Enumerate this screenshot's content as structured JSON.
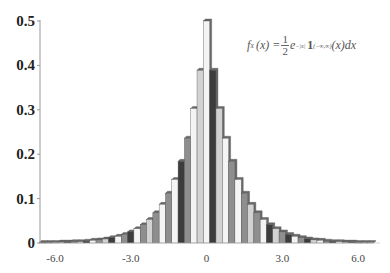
{
  "chart_data": {
    "type": "bar",
    "title": "",
    "annotation": "f_X(x) = 1/2 e^{-|x|} 1_{(-∞,∞)}(x) dx",
    "xlabel": "",
    "ylabel": "",
    "bin_width": 0.25,
    "xlim": [
      -6.625,
      6.625
    ],
    "ylim": [
      0,
      0.5
    ],
    "x_ticks": [
      -6.0,
      -3.0,
      0,
      3.0,
      6.0
    ],
    "x_tick_labels": [
      "-6.0",
      "-3.0",
      "0",
      "3.0",
      "6.0"
    ],
    "y_ticks": [
      0,
      0.1,
      0.2,
      0.3,
      0.4,
      0.5
    ],
    "y_tick_labels": [
      "0",
      "0.1",
      "0.2",
      "0.3",
      "0.4",
      "0.5"
    ],
    "grid": false,
    "legend": null,
    "categories": [
      -6.5,
      -6.25,
      -6.0,
      -5.75,
      -5.5,
      -5.25,
      -5.0,
      -4.75,
      -4.5,
      -4.25,
      -4.0,
      -3.75,
      -3.5,
      -3.25,
      -3.0,
      -2.75,
      -2.5,
      -2.25,
      -2.0,
      -1.75,
      -1.5,
      -1.25,
      -1.0,
      -0.75,
      -0.5,
      -0.25,
      0,
      0.25,
      0.5,
      0.75,
      1.0,
      1.25,
      1.5,
      1.75,
      2.0,
      2.25,
      2.5,
      2.75,
      3.0,
      3.25,
      3.5,
      3.75,
      4.0,
      4.25,
      4.5,
      4.75,
      5.0,
      5.25,
      5.5,
      5.75,
      6.0,
      6.25,
      6.5
    ],
    "values": [
      0.001,
      0.001,
      0.001,
      0.002,
      0.002,
      0.003,
      0.003,
      0.004,
      0.006,
      0.007,
      0.009,
      0.012,
      0.015,
      0.019,
      0.025,
      0.032,
      0.041,
      0.053,
      0.068,
      0.087,
      0.112,
      0.143,
      0.184,
      0.236,
      0.303,
      0.389,
      0.5,
      0.389,
      0.303,
      0.236,
      0.184,
      0.143,
      0.112,
      0.087,
      0.068,
      0.053,
      0.041,
      0.032,
      0.025,
      0.019,
      0.015,
      0.012,
      0.009,
      0.007,
      0.006,
      0.004,
      0.003,
      0.003,
      0.002,
      0.002,
      0.001,
      0.001,
      0.001
    ],
    "bar_colors": [
      "#f4f4f4",
      "#d2d2d2",
      "#8e8e8e",
      "#3c3c3c"
    ],
    "color_sequence": [
      3,
      2,
      0,
      1,
      3,
      2,
      1,
      3,
      0,
      2,
      1,
      3,
      0,
      2,
      3,
      0,
      2,
      1,
      2,
      0,
      2,
      0,
      3,
      2,
      0,
      1,
      0,
      3,
      1,
      0,
      2,
      0,
      2,
      1,
      2,
      0,
      3,
      1,
      2,
      3,
      0,
      2,
      3,
      1,
      0,
      2,
      3,
      0,
      1,
      3,
      2,
      1,
      0
    ]
  },
  "formula": {
    "lhs": "f",
    "lhs_sub": "X",
    "arg": "(x) =",
    "frac_num": "1",
    "frac_den": "2",
    "base": "e",
    "exp": "−|x|",
    "indicator": "1",
    "indicator_sub": "(−∞,∞)",
    "tail": "(x)dx"
  }
}
